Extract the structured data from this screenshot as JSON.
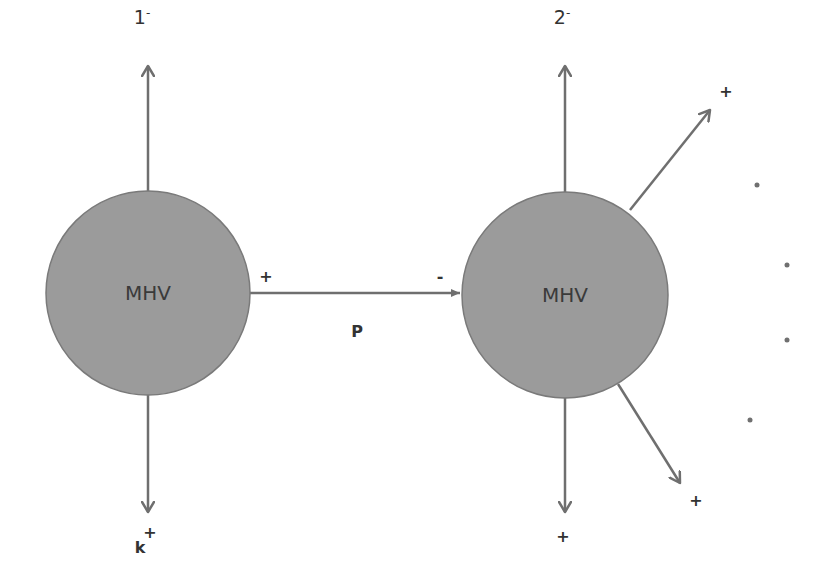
{
  "diagram": {
    "type": "mhv-diagram",
    "colors": {
      "node_fill": "#9b9b9b",
      "node_stroke": "#7a7a7a",
      "line": "#6f6f6f",
      "text": "#333333",
      "background": "#ffffff"
    },
    "nodes": [
      {
        "id": "left",
        "label": "MHV",
        "cx": 148,
        "cy": 293,
        "r": 102
      },
      {
        "id": "right",
        "label": "MHV",
        "cx": 565,
        "cy": 295,
        "r": 103
      }
    ],
    "legs": {
      "left_top": {
        "label": "1",
        "sup": "-"
      },
      "left_bottom": {
        "label": "k",
        "sup": "+"
      },
      "right_top": {
        "label": "2",
        "sup": "-"
      },
      "right_bottom": {
        "label": "+"
      },
      "right_upper_diag": {
        "label": "+"
      },
      "right_lower_diag": {
        "label": "+"
      }
    },
    "propagator": {
      "label": "P",
      "start_sign": "+",
      "end_sign": "-"
    },
    "ellipsis_dots": 4
  }
}
